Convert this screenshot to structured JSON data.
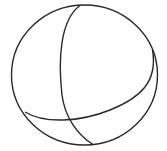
{
  "figure": {
    "stroke_color": "#2a2a2a",
    "background": "#ffffff"
  }
}
